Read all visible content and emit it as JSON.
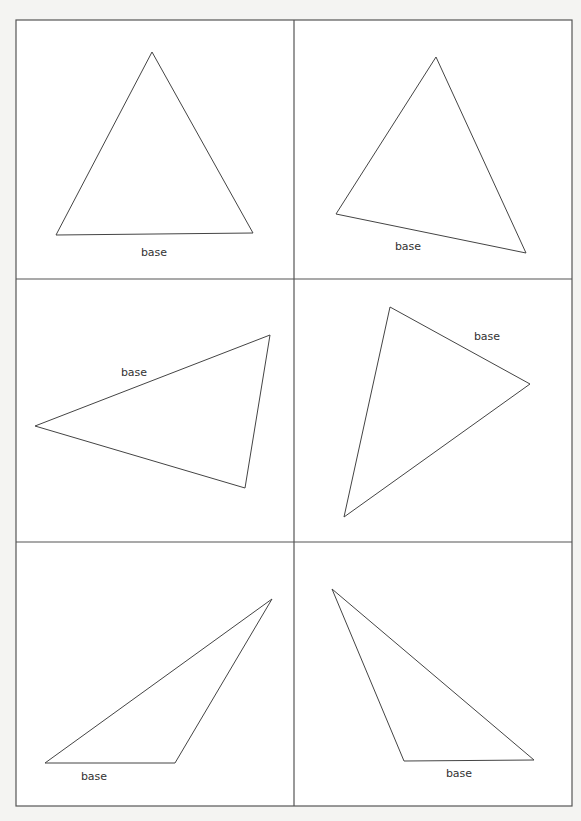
{
  "worksheet": {
    "panels": [
      {
        "id": "panel-1",
        "base_label": "base",
        "shape": "acute triangle, base horizontal at bottom"
      },
      {
        "id": "panel-2",
        "base_label": "base",
        "shape": "triangle rotated, base tilted at bottom"
      },
      {
        "id": "panel-3",
        "base_label": "base",
        "shape": "triangle with base as upper-left slanted side"
      },
      {
        "id": "panel-4",
        "base_label": "base",
        "shape": "triangle with base as upper-right slanted side"
      },
      {
        "id": "panel-5",
        "base_label": "base",
        "shape": "obtuse triangle, base horizontal at bottom-left"
      },
      {
        "id": "panel-6",
        "base_label": "base",
        "shape": "obtuse triangle, base horizontal at bottom-right"
      }
    ],
    "colors": {
      "paper": "#f4f4f2",
      "ink": "#333333",
      "grid": "#555555"
    }
  }
}
